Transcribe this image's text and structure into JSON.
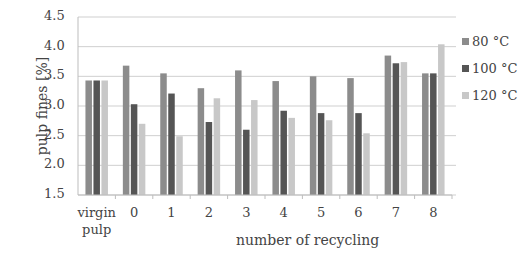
{
  "chart_data": {
    "type": "bar",
    "title": "",
    "xlabel": "number of recycling",
    "ylabel": "pulp fines  [%]",
    "ylim": [
      1.5,
      4.5
    ],
    "yticks": [
      "1.5",
      "2.0",
      "2.5",
      "3.0",
      "3.5",
      "4.0",
      "4.5"
    ],
    "grid": true,
    "legend_position": "right",
    "categories": [
      "virgin pulp",
      "0",
      "1",
      "2",
      "3",
      "4",
      "5",
      "6",
      "7",
      "8"
    ],
    "series": [
      {
        "name": "80 °C",
        "color": "#8c8c8c",
        "values": [
          3.43,
          3.68,
          3.55,
          3.3,
          3.6,
          3.42,
          3.5,
          3.47,
          3.85,
          3.55
        ]
      },
      {
        "name": "100 °C",
        "color": "#555555",
        "values": [
          3.43,
          3.03,
          3.21,
          2.73,
          2.6,
          2.92,
          2.88,
          2.88,
          3.72,
          3.55
        ]
      },
      {
        "name": "120 °C",
        "color": "#c8c8c8",
        "values": [
          3.43,
          2.7,
          2.49,
          3.13,
          3.1,
          2.8,
          2.76,
          2.54,
          3.74,
          4.04
        ]
      }
    ]
  },
  "labels": {
    "virgin_line1": "virgin",
    "virgin_line2": "pulp"
  }
}
